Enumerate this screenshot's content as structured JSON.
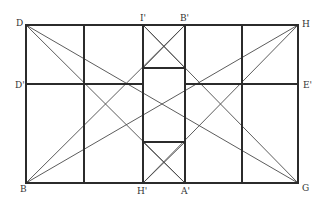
{
  "diagram": {
    "type": "geometric-construction",
    "background": "#ffffff",
    "line_color": "#2b2b2b",
    "labels": {
      "D": "D",
      "H": "H",
      "B": "B",
      "G": "G",
      "D_prime": "D'",
      "E_prime": "E'",
      "I_prime": "I'",
      "B_prime": "B'",
      "H_prime": "H'",
      "A_prime": "A'"
    },
    "points": {
      "D": [
        26,
        25
      ],
      "H": [
        298,
        25
      ],
      "B": [
        26,
        183
      ],
      "G": [
        298,
        183
      ],
      "D_prime": [
        26,
        84
      ],
      "E_prime": [
        298,
        84
      ],
      "I_prime": [
        143,
        25
      ],
      "B_prime": [
        185,
        25
      ],
      "H_prime": [
        143,
        183
      ],
      "A_prime": [
        185,
        183
      ]
    },
    "structure": {
      "outer_rectangle": [
        "D",
        "H",
        "G",
        "B"
      ],
      "vertical_lines_x": [
        84,
        143,
        185,
        242
      ],
      "middle_horizontal": [
        "D_prime",
        "E_prime"
      ],
      "top_square": {
        "x": [
          143,
          185
        ],
        "y": [
          25,
          68
        ],
        "crossed": true
      },
      "center_rectangle": {
        "x": [
          143,
          185
        ],
        "y": [
          68,
          142
        ]
      },
      "bottom_square": {
        "x": [
          143,
          185
        ],
        "y": [
          142,
          183
        ],
        "crossed": true
      },
      "diagonals": [
        [
          "D",
          "G"
        ],
        [
          "D",
          "A_prime"
        ],
        [
          "B",
          "H"
        ],
        [
          "B",
          "B_prime"
        ],
        [
          "H",
          "H_prime"
        ],
        [
          "G",
          "I_prime"
        ]
      ]
    }
  }
}
